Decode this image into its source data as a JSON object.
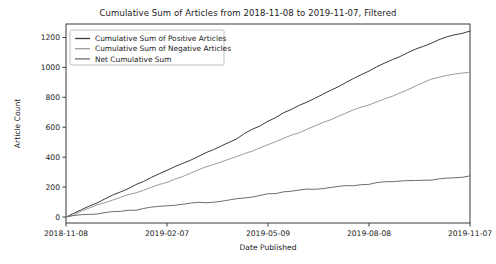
{
  "chart_data": {
    "type": "line",
    "title": "Cumulative Sum of Articles from 2018-11-08 to 2019-11-07, Filtered",
    "xlabel": "Date Published",
    "ylabel": "Article Count",
    "grid": false,
    "legend_position": "upper left",
    "xtick_labels": [
      "2018-11-08",
      "2019-02-07",
      "2019-05-09",
      "2019-08-08",
      "2019-11-07"
    ],
    "xtick_positions": [
      0,
      91,
      182,
      273,
      364
    ],
    "ytick_labels": [
      "0",
      "200",
      "400",
      "600",
      "800",
      "1000",
      "1200"
    ],
    "ytick_values": [
      0,
      200,
      400,
      600,
      800,
      1000,
      1200
    ],
    "xlim": [
      0,
      364
    ],
    "ylim": [
      -40,
      1290
    ],
    "x": [
      0,
      7,
      14,
      21,
      28,
      35,
      42,
      49,
      56,
      63,
      70,
      77,
      84,
      91,
      98,
      105,
      112,
      119,
      126,
      133,
      140,
      147,
      154,
      161,
      168,
      175,
      182,
      189,
      196,
      203,
      210,
      217,
      224,
      231,
      238,
      245,
      252,
      259,
      266,
      273,
      280,
      287,
      294,
      301,
      308,
      315,
      322,
      329,
      336,
      343,
      350,
      357,
      364
    ],
    "series": [
      {
        "name": "Cumulative Sum of Positive Articles",
        "color": "#3b3b3b",
        "values": [
          0,
          26,
          52,
          76,
          98,
          122,
          148,
          170,
          192,
          214,
          238,
          262,
          286,
          310,
          332,
          356,
          382,
          408,
          430,
          452,
          476,
          500,
          528,
          556,
          582,
          608,
          636,
          664,
          692,
          718,
          744,
          770,
          796,
          822,
          848,
          874,
          900,
          926,
          950,
          974,
          1000,
          1024,
          1048,
          1072,
          1096,
          1118,
          1142,
          1166,
          1188,
          1204,
          1218,
          1230,
          1243
        ]
      },
      {
        "name": "Cumulative Sum of Negative Articles",
        "color": "#9b9b9b",
        "values": [
          0,
          18,
          38,
          58,
          76,
          92,
          110,
          128,
          146,
          164,
          182,
          200,
          218,
          236,
          254,
          272,
          292,
          312,
          330,
          348,
          366,
          384,
          404,
          424,
          444,
          464,
          486,
          508,
          528,
          548,
          568,
          588,
          608,
          628,
          648,
          668,
          690,
          712,
          732,
          752,
          772,
          792,
          812,
          832,
          854,
          876,
          898,
          916,
          930,
          942,
          952,
          960,
          968
        ]
      },
      {
        "name": "Net Cumulative Sum",
        "color": "#6e6e6e",
        "values": [
          0,
          8,
          14,
          18,
          22,
          30,
          38,
          42,
          46,
          50,
          56,
          62,
          68,
          74,
          78,
          84,
          90,
          96,
          100,
          104,
          110,
          116,
          124,
          132,
          138,
          144,
          150,
          156,
          164,
          170,
          176,
          182,
          188,
          194,
          200,
          206,
          210,
          214,
          218,
          222,
          228,
          232,
          236,
          240,
          242,
          242,
          244,
          250,
          258,
          262,
          266,
          268,
          275
        ]
      }
    ]
  }
}
